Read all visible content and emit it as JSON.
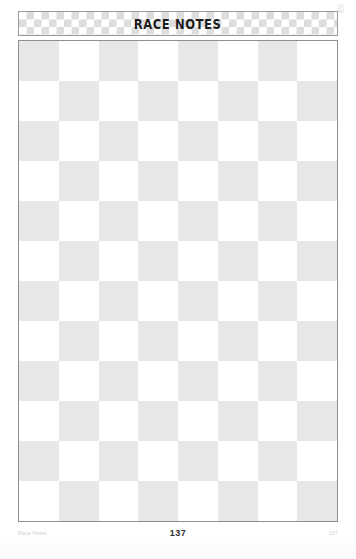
{
  "page": {
    "title": "RACE NOTES",
    "page_number": "137",
    "footer_left": "Race Notes",
    "footer_right": "137"
  },
  "colors": {
    "checker_gray": "#e6e7e7",
    "checker_white": "#ffffff",
    "border": "#8f8f8f",
    "header_checker_gray": "#dcdcdc",
    "title_text": "#1d1d1d",
    "page_number_text": "#2b2b2b",
    "footer_text": "#cdcdcd"
  },
  "notes_grid": {
    "columns": 8,
    "rows": 12,
    "start_color": "gray",
    "description": "Blank checkerboard note-taking area"
  },
  "header_banner": {
    "checker_size_px": 7.5,
    "rows": 3
  }
}
